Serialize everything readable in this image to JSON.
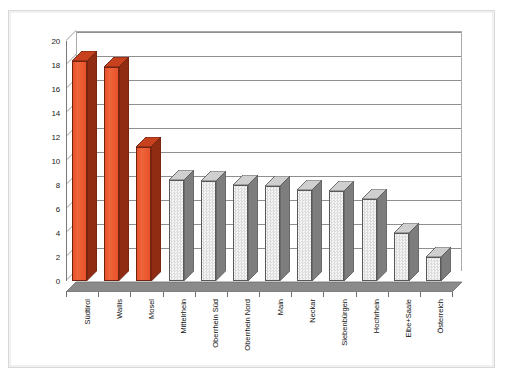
{
  "chart_data": {
    "type": "bar",
    "title": "",
    "subtitle": "",
    "xlabel": "",
    "ylabel": "",
    "ylim": [
      0,
      20
    ],
    "ytick_labels": [
      "0",
      "2",
      "4",
      "6",
      "8",
      "10",
      "12",
      "14",
      "16",
      "18",
      "20"
    ],
    "ytick_values": [
      0,
      2,
      4,
      6,
      8,
      10,
      12,
      14,
      16,
      18,
      20
    ],
    "grid": "horizontal",
    "legend": "none",
    "style": "3d-column",
    "categories": [
      "Südtirol",
      "Wallis",
      "Mosel",
      "Mittelrhein",
      "Oberrhein Süd",
      "Oberrhein Nord",
      "Main",
      "Neckar",
      "Siebenbürgen",
      "Hochrhein",
      "Elbe+Saale",
      "Österreich"
    ],
    "values": [
      18.3,
      17.8,
      11.2,
      8.4,
      8.3,
      8.0,
      7.9,
      7.6,
      7.5,
      6.8,
      4.0,
      2.0
    ],
    "bar_colors": [
      "#e8522a",
      "#e8522a",
      "#e8522a",
      "#ececec",
      "#ececec",
      "#ececec",
      "#ececec",
      "#ececec",
      "#ececec",
      "#ececec",
      "#ececec",
      "#ececec"
    ],
    "highlight_color": "#e8522a",
    "highlight_shade_color": "#8f2c12",
    "neutral_color": "#ececec",
    "neutral_shade_color": "#7d7d7d",
    "floor_color": "#8a8a8a",
    "gridline_color": "#8f8f8f",
    "axis_color": "#7a7a7a",
    "background_color": "#ffffff",
    "highlighted_categories": [
      "Südtirol",
      "Wallis",
      "Mosel"
    ]
  }
}
